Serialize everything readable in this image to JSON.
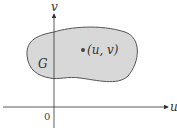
{
  "diagram": {
    "axes": {
      "x_label": "u",
      "y_label": "v",
      "origin_label": "0"
    },
    "region": {
      "label": "G",
      "fill": "#d8d8d8",
      "stroke": "#555555"
    },
    "point": {
      "label": "(u, v)"
    }
  }
}
